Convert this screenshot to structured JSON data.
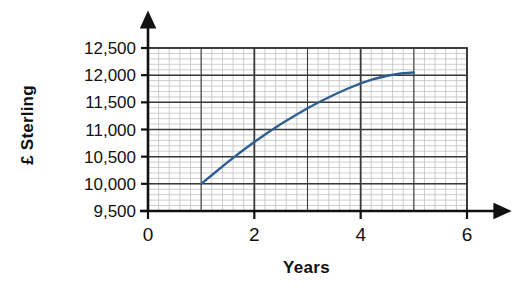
{
  "chart_data": {
    "type": "line",
    "title": "",
    "xlabel": "Years",
    "ylabel": "£ Sterling",
    "xlim": [
      0,
      6
    ],
    "ylim": [
      9500,
      12500
    ],
    "grid": true,
    "legend_position": "none",
    "x_ticks": [
      "0",
      "2",
      "4",
      "6"
    ],
    "x_tick_values": [
      0,
      2,
      4,
      6
    ],
    "y_ticks": [
      "9,500",
      "10,000",
      "10,500",
      "11,000",
      "11,500",
      "12,000",
      "12,500"
    ],
    "y_tick_values": [
      9500,
      10000,
      10500,
      11000,
      11500,
      12000,
      12500
    ],
    "x_minor_step": 0.2,
    "y_minor_step": 100,
    "series": [
      {
        "name": "Investment value",
        "color": "#2f5f91",
        "x": [
          1,
          1.25,
          1.5,
          1.75,
          2,
          2.25,
          2.5,
          2.75,
          3,
          3.25,
          3.5,
          3.75,
          4,
          4.25,
          4.5,
          4.75,
          5
        ],
        "values": [
          10000,
          10200,
          10400,
          10590,
          10770,
          10940,
          11100,
          11250,
          11390,
          11520,
          11640,
          11750,
          11850,
          11930,
          11990,
          12030,
          12050
        ]
      }
    ]
  },
  "axis": {
    "y_label_text": "£ Sterling",
    "x_label_text": "Years",
    "tick_color": "#1a1a1a",
    "major_grid_color": "#3a3a3a",
    "minor_grid_color": "#b9b9b9",
    "curve_color": "#2f5f91"
  }
}
